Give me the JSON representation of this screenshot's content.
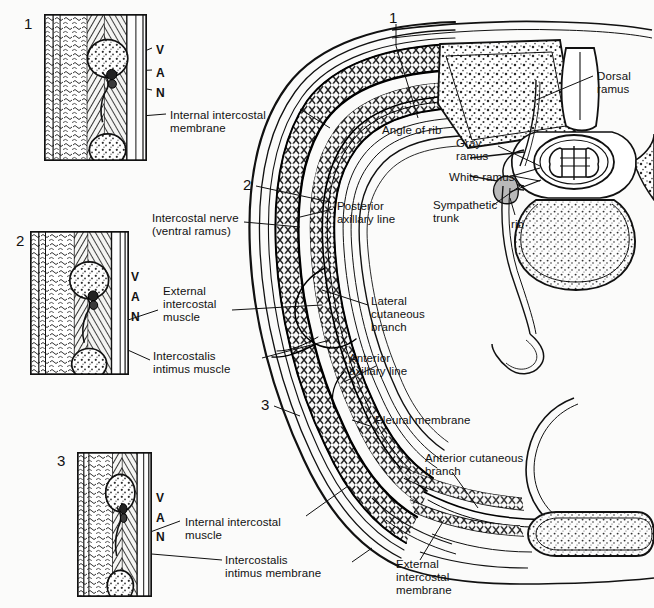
{
  "figure": {
    "width": 654,
    "height": 608,
    "background_color": "#fbfbfa",
    "ink_color": "#111111"
  },
  "markers": [
    {
      "id": "marker-1",
      "text": "1",
      "x": 389,
      "y": 10
    },
    {
      "id": "marker-2",
      "text": "2",
      "x": 243,
      "y": 177
    },
    {
      "id": "marker-3",
      "text": "3",
      "x": 261,
      "y": 397
    }
  ],
  "insets": [
    {
      "id": "inset-1",
      "number": "1",
      "number_x": 24,
      "number_y": 16,
      "box": {
        "x": 44,
        "y": 14,
        "w": 101,
        "h": 145
      },
      "van_labels": [
        {
          "text": "V",
          "x": 156,
          "y": 44
        },
        {
          "text": "A",
          "x": 156,
          "y": 67
        },
        {
          "text": "N",
          "x": 156,
          "y": 87
        }
      ],
      "callouts": [
        {
          "text": "Internal intercostal\nmembrane",
          "x": 170,
          "y": 109
        }
      ]
    },
    {
      "id": "inset-2",
      "number": "2",
      "number_x": 16,
      "number_y": 233,
      "box": {
        "x": 30,
        "y": 231,
        "w": 97,
        "h": 142
      },
      "van_labels": [
        {
          "text": "V",
          "x": 131,
          "y": 271
        },
        {
          "text": "A",
          "x": 131,
          "y": 291
        },
        {
          "text": "N",
          "x": 131,
          "y": 311
        }
      ],
      "callouts": [
        {
          "text": "External\nintercostal\nmuscle",
          "x": 163,
          "y": 285
        },
        {
          "text": "Intercostalis\nintimus muscle",
          "x": 153,
          "y": 350
        }
      ]
    },
    {
      "id": "inset-3",
      "number": "3",
      "number_x": 57,
      "number_y": 453,
      "box": {
        "x": 77,
        "y": 452,
        "w": 73,
        "h": 143
      },
      "van_labels": [
        {
          "text": "V",
          "x": 156,
          "y": 492
        },
        {
          "text": "A",
          "x": 156,
          "y": 512
        },
        {
          "text": "N",
          "x": 156,
          "y": 531
        }
      ],
      "callouts": [
        {
          "text": "Internal intercostal\nmuscle",
          "x": 185,
          "y": 516
        },
        {
          "text": "Intercostalis\nintimus membrane",
          "x": 225,
          "y": 554
        }
      ]
    }
  ],
  "labels": [
    {
      "id": "label-angle-of-rib",
      "text": "Angle of rib",
      "x": 382,
      "y": 124,
      "align": "left"
    },
    {
      "id": "label-dorsal-ramus",
      "text": "Dorsal\nramus",
      "x": 597,
      "y": 70,
      "align": "left"
    },
    {
      "id": "label-gray-ramus",
      "text": "Gray\nramus",
      "x": 456,
      "y": 137,
      "align": "left"
    },
    {
      "id": "label-white-ramus",
      "text": "White ramus",
      "x": 449,
      "y": 171,
      "align": "left"
    },
    {
      "id": "label-sympathetic-trunk",
      "text": "Sympathetic\ntrunk",
      "x": 433,
      "y": 199,
      "align": "left"
    },
    {
      "id": "label-rib",
      "text": "rib",
      "x": 511,
      "y": 218,
      "align": "left"
    },
    {
      "id": "label-intercostal-nerve",
      "text": "Intercostal nerve\n(ventral ramus)",
      "x": 152,
      "y": 212,
      "align": "left"
    },
    {
      "id": "label-posterior-axillary",
      "text": "Posterior\naxillary line",
      "x": 337,
      "y": 200,
      "align": "left"
    },
    {
      "id": "label-lateral-cutaneous",
      "text": "Lateral\ncutaneous\nbranch",
      "x": 371,
      "y": 295,
      "align": "left"
    },
    {
      "id": "label-anterior-axillary",
      "text": "Anterior\naxillary line",
      "x": 349,
      "y": 352,
      "align": "left"
    },
    {
      "id": "label-pleural-membrane",
      "text": "Pleural membrane",
      "x": 375,
      "y": 414,
      "align": "left"
    },
    {
      "id": "label-anterior-cutaneous",
      "text": "Anterior cutaneous\nbranch",
      "x": 425,
      "y": 452,
      "align": "left"
    },
    {
      "id": "label-external-intercostal-membrane",
      "text": "External\nintercostal\nmembrane",
      "x": 396,
      "y": 558,
      "align": "left"
    }
  ],
  "anatomy_keys": {
    "V": "vein",
    "A": "artery",
    "N": "nerve"
  }
}
